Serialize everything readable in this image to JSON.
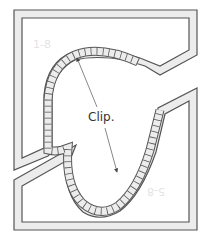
{
  "diagram": {
    "title": "",
    "labels": {
      "clip": "Clip.",
      "top_left_mark": "1-8",
      "bottom_right_mark": "5-8"
    },
    "colors": {
      "stroke": "#555555",
      "fill_band": "#ececec",
      "background": "#ffffff",
      "faint_label": "#e6e6e6",
      "arrow": "#444444"
    },
    "components": [
      {
        "name": "upper-panel",
        "description": "upper-left panel frame with notched right edge"
      },
      {
        "name": "lower-panel",
        "description": "lower-right panel frame with notched left edge"
      },
      {
        "name": "clip-strip",
        "description": "segmented curved clip strip following heart-shaped path"
      },
      {
        "name": "clip-arrows",
        "description": "double-headed arrow pointing to clip strip ends"
      }
    ]
  }
}
